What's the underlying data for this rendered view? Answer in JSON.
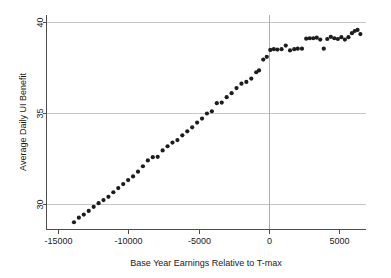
{
  "chart_data": {
    "type": "scatter",
    "title": "",
    "xlabel": "Base Year Earnings Relative to T-max",
    "ylabel": "Average Daily UI Benefit",
    "xlim": [
      -15800,
      6900
    ],
    "ylim": [
      28.6,
      40.4
    ],
    "xticks": [
      -15000,
      -10000,
      -5000,
      0,
      5000
    ],
    "xticklabels": [
      "-15000",
      "-10000",
      "-5000",
      "0",
      "5000"
    ],
    "yticks": [
      30,
      35,
      40
    ],
    "yticklabels": [
      "30",
      "35",
      "40"
    ],
    "grid": "horizontal",
    "gridlines_y": [
      30,
      35,
      40
    ],
    "reference_line_x": 0,
    "legend": "none",
    "marker": "filled-circle",
    "marker_color": "#1c1c1c",
    "marker_size": 2.1,
    "points": [
      {
        "x": -13850,
        "y": 29.0
      },
      {
        "x": -13500,
        "y": 29.25
      },
      {
        "x": -13150,
        "y": 29.42
      },
      {
        "x": -12800,
        "y": 29.62
      },
      {
        "x": -12450,
        "y": 29.85
      },
      {
        "x": -12100,
        "y": 30.05
      },
      {
        "x": -11750,
        "y": 30.22
      },
      {
        "x": -11400,
        "y": 30.4
      },
      {
        "x": -11050,
        "y": 30.65
      },
      {
        "x": -10700,
        "y": 30.88
      },
      {
        "x": -10350,
        "y": 31.1
      },
      {
        "x": -10000,
        "y": 31.32
      },
      {
        "x": -9650,
        "y": 31.52
      },
      {
        "x": -9300,
        "y": 31.78
      },
      {
        "x": -8950,
        "y": 32.08
      },
      {
        "x": -8600,
        "y": 32.4
      },
      {
        "x": -8250,
        "y": 32.58
      },
      {
        "x": -7900,
        "y": 32.6
      },
      {
        "x": -7550,
        "y": 32.95
      },
      {
        "x": -7200,
        "y": 33.18
      },
      {
        "x": -6850,
        "y": 33.38
      },
      {
        "x": -6500,
        "y": 33.52
      },
      {
        "x": -6150,
        "y": 33.78
      },
      {
        "x": -5800,
        "y": 34.0
      },
      {
        "x": -5450,
        "y": 34.22
      },
      {
        "x": -5100,
        "y": 34.48
      },
      {
        "x": -4750,
        "y": 34.7
      },
      {
        "x": -4400,
        "y": 34.98
      },
      {
        "x": -4050,
        "y": 35.1
      },
      {
        "x": -3700,
        "y": 35.55
      },
      {
        "x": -3350,
        "y": 35.58
      },
      {
        "x": -3000,
        "y": 35.88
      },
      {
        "x": -2650,
        "y": 36.1
      },
      {
        "x": -2300,
        "y": 36.38
      },
      {
        "x": -1950,
        "y": 36.62
      },
      {
        "x": -1600,
        "y": 36.72
      },
      {
        "x": -1250,
        "y": 36.9
      },
      {
        "x": -900,
        "y": 37.25
      },
      {
        "x": -700,
        "y": 37.35
      },
      {
        "x": -400,
        "y": 37.95
      },
      {
        "x": -150,
        "y": 38.1
      },
      {
        "x": 100,
        "y": 38.48
      },
      {
        "x": 350,
        "y": 38.52
      },
      {
        "x": 600,
        "y": 38.5
      },
      {
        "x": 900,
        "y": 38.52
      },
      {
        "x": 1200,
        "y": 38.72
      },
      {
        "x": 1500,
        "y": 38.45
      },
      {
        "x": 1800,
        "y": 38.52
      },
      {
        "x": 2050,
        "y": 38.55
      },
      {
        "x": 2350,
        "y": 38.55
      },
      {
        "x": 2650,
        "y": 39.1
      },
      {
        "x": 2900,
        "y": 39.12
      },
      {
        "x": 3150,
        "y": 39.12
      },
      {
        "x": 3400,
        "y": 39.15
      },
      {
        "x": 3650,
        "y": 39.05
      },
      {
        "x": 3900,
        "y": 38.55
      },
      {
        "x": 4150,
        "y": 39.08
      },
      {
        "x": 4400,
        "y": 39.2
      },
      {
        "x": 4650,
        "y": 39.12
      },
      {
        "x": 4900,
        "y": 39.08
      },
      {
        "x": 5150,
        "y": 39.18
      },
      {
        "x": 5400,
        "y": 39.05
      },
      {
        "x": 5650,
        "y": 39.18
      },
      {
        "x": 5900,
        "y": 39.4
      },
      {
        "x": 6100,
        "y": 39.52
      },
      {
        "x": 6300,
        "y": 39.58
      },
      {
        "x": 6500,
        "y": 39.35
      }
    ]
  }
}
